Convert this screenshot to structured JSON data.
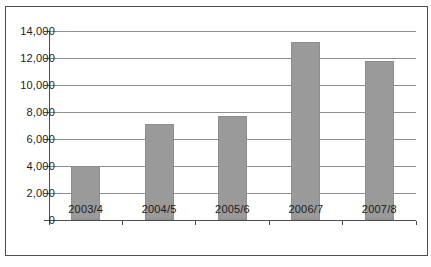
{
  "chart_data": {
    "type": "bar",
    "title": "",
    "xlabel": "",
    "ylabel": "",
    "categories": [
      "2003/4",
      "2004/5",
      "2005/6",
      "2006/7",
      "2007/8"
    ],
    "values": [
      4000,
      7100,
      7700,
      13200,
      11800
    ],
    "ylim": [
      0,
      14000
    ],
    "ytick_step": 2000,
    "yticks": [
      0,
      2000,
      4000,
      6000,
      8000,
      10000,
      12000,
      14000
    ],
    "ytick_labels": [
      "0",
      "2,000",
      "4,000",
      "6,000",
      "8,000",
      "10,000",
      "12,000",
      "14,000"
    ],
    "grid": true,
    "legend": "none",
    "colors": {
      "bar_fill": "#9a9a9a",
      "bar_edge": "#8d8d8d",
      "gridline": "#8f8f8f",
      "axis": "#4d4d4d",
      "frame_border": "#4d4d4d",
      "text": "#1c1c1c",
      "plot_background": "#ffffff"
    },
    "layout": {
      "plot_left": 48,
      "plot_top": 30,
      "plot_width": 367,
      "plot_height": 189,
      "bar_width": 29
    }
  }
}
